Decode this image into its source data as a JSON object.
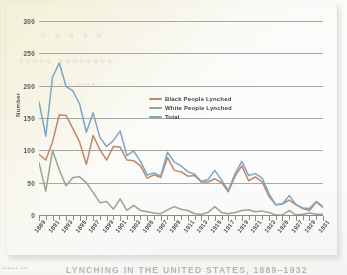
{
  "page": {
    "ghost_text_line1": "• • •   • •",
    "ghost_text_line2": "••••• ••••••••",
    "ghost_text_line3": "••• ••••",
    "bottom_caption": "LYNCHING IN THE UNITED STATES, 1889–1932",
    "left_caption": "••••••  •••"
  },
  "colors": {
    "black_lynched": "#c08a6e",
    "white_lynched": "#9aa893",
    "total": "#7fa8c6",
    "gridline": "#9a9a98",
    "axis": "#8d8d8b",
    "tick_text": "#5a5a58",
    "paper_cream": "#f4f0d5",
    "card_white": "#ffffff"
  },
  "legend": {
    "position": "inside-top-center",
    "items": [
      {
        "label": "Black People Lynched",
        "color": "#c08a6e",
        "key": "black"
      },
      {
        "label": "White People Lynched",
        "color": "#9aa893",
        "key": "white"
      },
      {
        "label": "Total",
        "color": "#7fa8c6",
        "key": "total"
      }
    ]
  },
  "chart_data": {
    "type": "line",
    "title": "",
    "subtitle": "",
    "xlabel": "",
    "ylabel": "Number",
    "ylim": [
      0,
      300
    ],
    "yticks": [
      0,
      50,
      100,
      150,
      200,
      250,
      300
    ],
    "ytick_labels": [
      "0",
      "50",
      "100",
      "150",
      "200",
      "250",
      "300"
    ],
    "grid": true,
    "grid_axis": "y",
    "legend_position": "inside-top-center",
    "x": [
      1889,
      1890,
      1891,
      1892,
      1893,
      1894,
      1895,
      1896,
      1897,
      1898,
      1899,
      1900,
      1901,
      1902,
      1903,
      1904,
      1905,
      1906,
      1907,
      1908,
      1909,
      1910,
      1911,
      1912,
      1913,
      1914,
      1915,
      1916,
      1917,
      1918,
      1919,
      1920,
      1921,
      1922,
      1923,
      1924,
      1925,
      1926,
      1927,
      1928,
      1929,
      1930,
      1931
    ],
    "xtick_labels": [
      "1889",
      "1891",
      "1893",
      "1895",
      "1897",
      "1899",
      "1901",
      "1903",
      "1905",
      "1907",
      "1909",
      "1911",
      "1913",
      "1915",
      "1917",
      "1919",
      "1921",
      "1923",
      "1925",
      "1927",
      "1929",
      "1931"
    ],
    "xtick_interval_years": 2,
    "xtick_minor_every_year": true,
    "series": [
      {
        "name": "Black People Lynched",
        "color": "#c08a6e",
        "values": [
          94,
          85,
          113,
          155,
          154,
          134,
          113,
          78,
          123,
          101,
          85,
          106,
          105,
          85,
          84,
          76,
          57,
          62,
          58,
          89,
          69,
          67,
          60,
          61,
          51,
          51,
          56,
          50,
          36,
          60,
          76,
          53,
          59,
          51,
          29,
          16,
          17,
          23,
          16,
          10,
          7,
          20,
          12
        ]
      },
      {
        "name": "White People Lynched",
        "color": "#9aa893",
        "values": [
          81,
          37,
          100,
          70,
          45,
          58,
          59,
          50,
          35,
          19,
          21,
          9,
          25,
          7,
          15,
          7,
          5,
          3,
          2,
          8,
          13,
          9,
          7,
          2,
          1,
          4,
          13,
          4,
          2,
          4,
          7,
          8,
          5,
          6,
          4,
          0,
          0,
          7,
          0,
          1,
          3,
          1,
          1
        ]
      },
      {
        "name": "Total",
        "color": "#7fa8c6",
        "values": [
          175,
          122,
          213,
          235,
          199,
          192,
          172,
          128,
          158,
          120,
          106,
          115,
          130,
          92,
          99,
          83,
          62,
          65,
          60,
          97,
          82,
          76,
          67,
          63,
          52,
          55,
          69,
          54,
          38,
          64,
          83,
          61,
          64,
          57,
          33,
          16,
          17,
          30,
          16,
          11,
          10,
          21,
          13
        ]
      }
    ]
  }
}
